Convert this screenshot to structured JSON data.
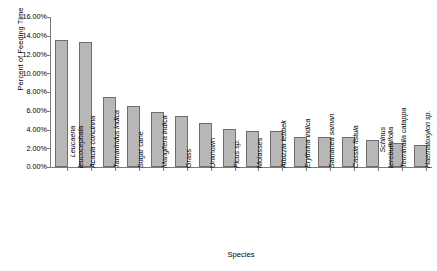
{
  "chart_data": {
    "type": "bar",
    "title": "",
    "xlabel": "Species",
    "ylabel": "Percent of Feeding Time",
    "ylim": [
      0,
      16
    ],
    "ytick_labels": [
      "0.00%",
      "2.00%",
      "4.00%",
      "6.00%",
      "8.00%",
      "10.00%",
      "12.00%",
      "14.00%",
      "16.00%"
    ],
    "ytick_values": [
      0,
      2,
      4,
      6,
      8,
      10,
      12,
      14,
      16
    ],
    "grid": false,
    "legend": "none",
    "bar_color": "#b7b7b7",
    "bar_border_color": "#6e6e6e",
    "axis_color": "#7a7a7a",
    "categories": [
      "Leucaena leucocephala",
      "Acacia concinna",
      "Tamarindus indica",
      "Sugar cane",
      "Mangifera indica",
      "Grass",
      "Unknown",
      "Ficus sp.",
      "Molasses",
      "Albizzia lebbek",
      "Erythrina indica",
      "Samanea saman",
      "Cassia fistula",
      "Schinus terebuthifolia",
      "Terminalia catappa",
      "Haematoxylon sp."
    ],
    "category_lines": [
      [
        "Leucaena",
        "leucocephala"
      ],
      [
        "Acacia concinna",
        ""
      ],
      [
        "Tamarindus indica",
        ""
      ],
      [
        "Sugar cane",
        ""
      ],
      [
        "Mangifera indica",
        ""
      ],
      [
        "Grass",
        ""
      ],
      [
        "Unknown",
        ""
      ],
      [
        "Ficus sp.",
        ""
      ],
      [
        "Molasses",
        ""
      ],
      [
        "Albizzia lebbek",
        ""
      ],
      [
        "Erythrina indica",
        ""
      ],
      [
        "Samanea saman",
        ""
      ],
      [
        "Cassia fistula",
        ""
      ],
      [
        "Schinus",
        "terebuthifolia"
      ],
      [
        "Terminalia catappa",
        ""
      ],
      [
        "Haematoxylon sp.",
        ""
      ]
    ],
    "category_italic": [
      true,
      true,
      true,
      false,
      true,
      false,
      false,
      true,
      false,
      true,
      true,
      true,
      true,
      true,
      true,
      true
    ],
    "values": [
      13.6,
      13.3,
      7.5,
      6.5,
      5.9,
      5.45,
      4.65,
      4.1,
      3.85,
      3.85,
      3.2,
      3.15,
      3.2,
      2.9,
      2.55,
      2.4
    ]
  }
}
